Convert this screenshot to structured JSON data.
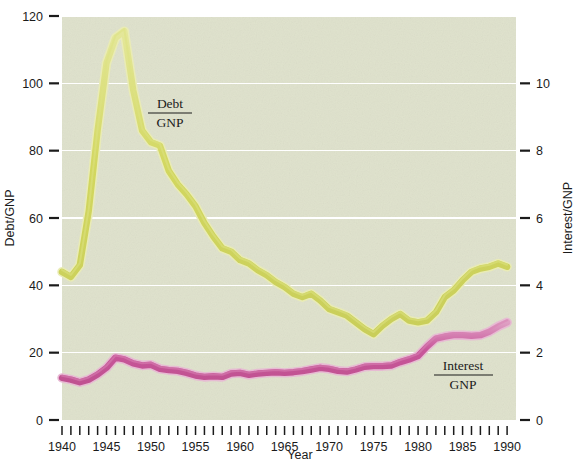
{
  "figure": {
    "background": "#ffffff",
    "plot_background": "#dfe2cc",
    "gridline_color": "#ffffff",
    "tick_color": "#1b1b1b"
  },
  "axes": {
    "left": {
      "title": "Debt/GNP",
      "ticks": [
        "0",
        "20",
        "40",
        "60",
        "80",
        "100",
        "120"
      ],
      "values": [
        0,
        20,
        40,
        60,
        80,
        100,
        120
      ],
      "min": 0,
      "max": 120
    },
    "right": {
      "title": "Interest/GNP",
      "ticks": [
        "0",
        "2",
        "4",
        "6",
        "8",
        "10"
      ],
      "values": [
        0,
        2,
        4,
        6,
        8,
        10
      ],
      "min": 0,
      "max": 12
    },
    "bottom": {
      "title": "Year",
      "ticks": [
        "1940",
        "1945",
        "1950",
        "1955",
        "1960",
        "1965",
        "1970",
        "1975",
        "1980",
        "1985",
        "1990"
      ],
      "tick_values": [
        1940,
        1945,
        1950,
        1955,
        1960,
        1965,
        1970,
        1975,
        1980,
        1985,
        1990
      ],
      "min": 1940,
      "max": 1991,
      "minor_every": 1
    }
  },
  "annotations": [
    {
      "name": "debt-series-label",
      "line1": "Debt",
      "line2": "GNP",
      "x": 170,
      "y": 112
    },
    {
      "name": "interest-series-label",
      "line1": "Interest",
      "line2": "GNP",
      "x": 463,
      "y": 374
    }
  ],
  "chart_data": {
    "type": "line",
    "title": "",
    "xlabel": "Year",
    "ylabel": "Debt/GNP",
    "y2label": "Interest/GNP",
    "grid": true,
    "legend": "inline-annotations",
    "xlim": [
      1940,
      1991
    ],
    "ylim": [
      0,
      120
    ],
    "y2lim": [
      0,
      12
    ],
    "x": [
      1940,
      1941,
      1942,
      1943,
      1944,
      1945,
      1946,
      1947,
      1948,
      1949,
      1950,
      1951,
      1952,
      1953,
      1954,
      1955,
      1956,
      1957,
      1958,
      1959,
      1960,
      1961,
      1962,
      1963,
      1964,
      1965,
      1966,
      1967,
      1968,
      1969,
      1970,
      1971,
      1972,
      1973,
      1974,
      1975,
      1976,
      1977,
      1978,
      1979,
      1980,
      1981,
      1982,
      1983,
      1984,
      1985,
      1986,
      1987,
      1988,
      1989,
      1990
    ],
    "series": [
      {
        "name": "Debt/GNP",
        "axis": "left",
        "color": "#d4d86a",
        "values": [
          44.0,
          42.5,
          46.0,
          62.0,
          86.0,
          106.0,
          113.5,
          115.5,
          98.0,
          86.0,
          82.5,
          81.5,
          74.0,
          70.0,
          67.0,
          63.5,
          58.5,
          54.5,
          51.0,
          50.0,
          47.5,
          46.5,
          44.5,
          43.0,
          41.0,
          39.5,
          37.5,
          36.5,
          37.5,
          35.5,
          33.0,
          32.0,
          31.0,
          29.0,
          27.0,
          25.5,
          28.0,
          30.0,
          31.5,
          29.5,
          29.0,
          29.5,
          32.0,
          36.5,
          38.5,
          41.5,
          44.0,
          45.0,
          45.5,
          46.5,
          45.5
        ]
      },
      {
        "name": "Interest/GNP",
        "axis": "right",
        "color": "#cc5f9b",
        "values": [
          1.25,
          1.2,
          1.12,
          1.2,
          1.35,
          1.55,
          1.85,
          1.8,
          1.68,
          1.62,
          1.64,
          1.52,
          1.48,
          1.46,
          1.4,
          1.32,
          1.28,
          1.3,
          1.28,
          1.38,
          1.4,
          1.34,
          1.38,
          1.4,
          1.42,
          1.4,
          1.42,
          1.45,
          1.5,
          1.55,
          1.52,
          1.46,
          1.44,
          1.5,
          1.58,
          1.6,
          1.6,
          1.62,
          1.72,
          1.8,
          1.9,
          2.18,
          2.42,
          2.48,
          2.52,
          2.52,
          2.5,
          2.52,
          2.62,
          2.78,
          2.9
        ]
      }
    ]
  },
  "geometry": {
    "plot_left": 62,
    "plot_right": 516,
    "plot_top": 16,
    "plot_bottom": 420
  }
}
